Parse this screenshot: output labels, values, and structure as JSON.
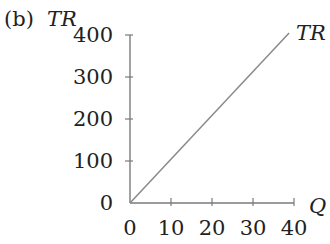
{
  "chart_data": {
    "type": "line",
    "panel_label": "(b)",
    "title": "",
    "xlabel": "Q",
    "ylabel": "TR",
    "xlim": [
      0,
      40
    ],
    "ylim": [
      0,
      400
    ],
    "x_ticks": [
      "0",
      "10",
      "20",
      "30",
      "40"
    ],
    "y_ticks": [
      "0",
      "100",
      "200",
      "300",
      "400"
    ],
    "grid": false,
    "legend": "none",
    "series": [
      {
        "name": "TR",
        "label": "TR",
        "x": [
          0,
          10,
          20,
          30,
          38.8
        ],
        "values": [
          0,
          100,
          200,
          300,
          405
        ],
        "color": "#8a8a8a"
      }
    ]
  },
  "colors": {
    "axis": "#7a7a7a",
    "line": "#8a8a8a",
    "text": "#222222"
  }
}
